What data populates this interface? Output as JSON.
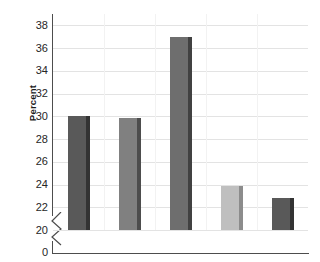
{
  "chart_data": {
    "type": "bar",
    "title": "",
    "xlabel": "",
    "ylabel": "Percent",
    "categories": [
      "",
      "",
      "",
      "",
      ""
    ],
    "values": [
      30.0,
      29.9,
      37.0,
      23.9,
      22.8
    ],
    "bar_colors": [
      "#595959",
      "#808080",
      "#6e6e6e",
      "#bfbfbf",
      "#595959"
    ],
    "bar_side_colors": [
      "#333333",
      "#4d4d4d",
      "#414141",
      "#8c8c8c",
      "#333333"
    ],
    "ylim": [
      20,
      39
    ],
    "yticks": [
      20,
      22,
      24,
      26,
      28,
      30,
      32,
      34,
      36,
      38
    ],
    "ytick_labels": [
      "20",
      "22",
      "24",
      "26",
      "28",
      "30",
      "32",
      "34",
      "36",
      "38"
    ],
    "axis_break": true,
    "axis_break_label": "0",
    "grid": true,
    "grid_color": "#e3e3e3",
    "legend": false,
    "legend_position": "none",
    "axis_color": "#4d4d4d",
    "background": "#ffffff"
  },
  "labels": {
    "y_axis_title": "Percent",
    "zero_label": "0"
  }
}
